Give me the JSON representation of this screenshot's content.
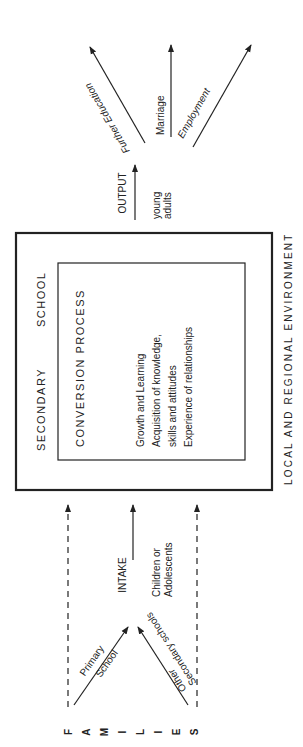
{
  "diagram": {
    "orientation": "rotated 90 degrees counter-clockwise",
    "environment_label": "LOCAL AND REGIONAL ENVIRONMENT",
    "families_label": [
      "F",
      "A",
      "M",
      "I",
      "L",
      "I",
      "E",
      "S"
    ],
    "inputs": [
      {
        "label_line1": "Primary",
        "label_line2": "School"
      },
      {
        "label_line1": "Other",
        "label_line2": "Secondary schools"
      }
    ],
    "intake": {
      "title": "INTAKE",
      "subtitle_line1": "Children or",
      "subtitle_line2": "Adolescents"
    },
    "outer_box": {
      "title_word1": "SECONDARY",
      "title_word2": "SCHOOL"
    },
    "inner_box": {
      "title": "CONVERSION PROCESS",
      "lines": [
        "Growth and Learning",
        "Acquisition of knowledge,",
        "skills and attitudes",
        "Experience of relationships"
      ]
    },
    "output": {
      "title": "OUTPUT",
      "subtitle_line1": "young",
      "subtitle_line2": "adults"
    },
    "destinations": [
      {
        "label": "Further Education"
      },
      {
        "label": "Marriage"
      },
      {
        "label": "Employment"
      }
    ],
    "colors": {
      "ink": "#222222",
      "background": "#ffffff"
    }
  }
}
